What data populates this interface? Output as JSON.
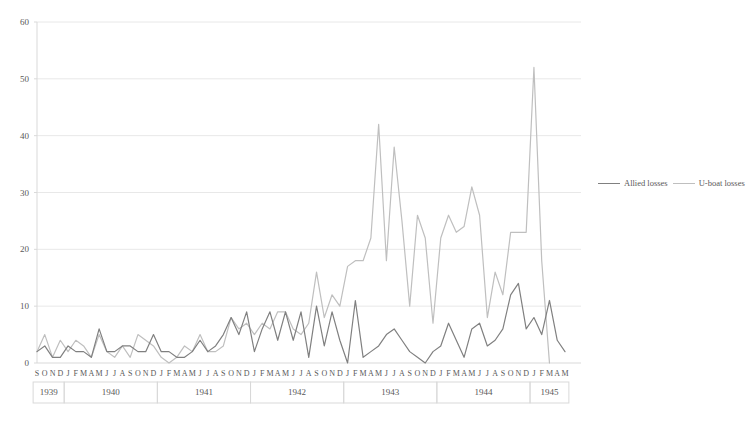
{
  "chart_data": {
    "type": "line",
    "title": "",
    "xlabel": "",
    "ylabel": "",
    "ylim": [
      0,
      60
    ],
    "yticks": [
      0,
      10,
      20,
      30,
      40,
      50,
      60
    ],
    "grid": true,
    "legend_position": "right",
    "colors": {
      "allied_losses": "#808080",
      "u_boat_losses": "#bfbfbf",
      "gridline": "#e8e8e8",
      "axis": "#d9d9d9",
      "text": "#595959"
    },
    "x_months": [
      "S",
      "O",
      "N",
      "D",
      "J",
      "F",
      "M",
      "A",
      "M",
      "J",
      "J",
      "A",
      "S",
      "O",
      "N",
      "D",
      "J",
      "F",
      "M",
      "A",
      "M",
      "J",
      "J",
      "A",
      "S",
      "O",
      "N",
      "D",
      "J",
      "F",
      "M",
      "A",
      "M",
      "J",
      "J",
      "A",
      "S",
      "O",
      "N",
      "D",
      "J",
      "F",
      "M",
      "A",
      "M",
      "J",
      "J",
      "A",
      "S",
      "O",
      "N",
      "D",
      "J",
      "F",
      "M",
      "A",
      "M",
      "J",
      "J",
      "A",
      "S",
      "O",
      "N",
      "D",
      "J",
      "F",
      "M",
      "A",
      "M"
    ],
    "x_year_groups": [
      {
        "label": "1939",
        "count": 4
      },
      {
        "label": "1940",
        "count": 12
      },
      {
        "label": "1941",
        "count": 12
      },
      {
        "label": "1942",
        "count": 12
      },
      {
        "label": "1943",
        "count": 12
      },
      {
        "label": "1944",
        "count": 12
      },
      {
        "label": "1945",
        "count": 5
      }
    ],
    "series": [
      {
        "name": "Allied losses",
        "color": "#808080",
        "values": [
          2,
          3,
          1,
          1,
          3,
          2,
          2,
          1,
          6,
          2,
          2,
          3,
          3,
          2,
          2,
          5,
          2,
          2,
          1,
          1,
          2,
          4,
          2,
          3,
          5,
          8,
          5,
          9,
          2,
          6,
          9,
          4,
          9,
          4,
          9,
          1,
          10,
          3,
          9,
          4,
          0,
          11,
          1,
          2,
          3,
          5,
          6,
          4,
          2,
          1,
          0,
          2,
          3,
          7,
          4,
          1,
          6,
          7,
          3,
          4,
          6,
          12,
          14,
          6,
          8,
          5,
          11,
          4,
          2
        ]
      },
      {
        "name": "U-boat losses",
        "color": "#bfbfbf",
        "values": [
          2,
          5,
          1,
          4,
          2,
          4,
          3,
          1,
          5,
          2,
          1,
          3,
          1,
          5,
          4,
          3,
          1,
          0,
          1,
          3,
          2,
          5,
          2,
          2,
          3,
          8,
          6,
          7,
          5,
          7,
          6,
          9,
          9,
          6,
          5,
          7,
          16,
          8,
          12,
          10,
          17,
          18,
          18,
          22,
          42,
          18,
          38,
          25,
          10,
          26,
          22,
          7,
          22,
          26,
          23,
          24,
          31,
          26,
          8,
          16,
          12,
          23,
          23,
          23,
          52,
          18,
          0,
          0,
          0
        ]
      }
    ],
    "annotations": []
  },
  "legend": {
    "items": [
      {
        "label": "Allied losses",
        "color": "#808080"
      },
      {
        "label": "U-boat losses",
        "color": "#bfbfbf"
      }
    ]
  }
}
